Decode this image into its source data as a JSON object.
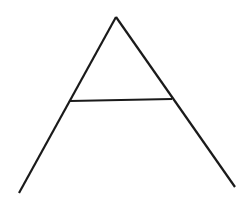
{
  "figure": {
    "background": "#ffffff",
    "stroke_color": "#1a1a1a",
    "stroke_width": 2.2
  },
  "shapes": {
    "left_leg": {
      "x1": 19,
      "y1": 193,
      "x2": 116,
      "y2": 17
    },
    "right_leg": {
      "x1": 116,
      "y1": 17,
      "x2": 235,
      "y2": 187
    },
    "crossbar": {
      "x1": 70,
      "y1": 101,
      "x2": 172,
      "y2": 99
    }
  }
}
